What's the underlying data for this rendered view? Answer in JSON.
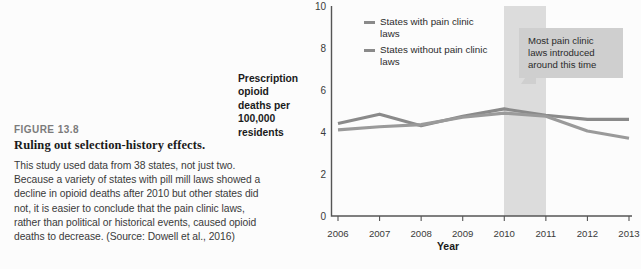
{
  "figure": {
    "label": "FIGURE 13.8",
    "title": "Ruling out selection-history effects.",
    "body": "This study used data from 38 states, not just two. Because a variety of states with pill mill laws showed a decline in opioid deaths after 2010 but other states did not, it is easier to conclude that the pain clinic laws, rather than political or historical events, caused opioid deaths to decrease. (Source: Dowell et al., 2016)"
  },
  "callout": {
    "text": "Most pain clinic laws introduced around this time"
  },
  "colors": {
    "series_with": "#8a8a8a",
    "series_without": "#9a9a9a",
    "band": "#dcdcdc",
    "callout_bg": "#cfcfcf",
    "axis": "#555555",
    "background": "#fcfcfc"
  },
  "chart_data": {
    "type": "line",
    "title": "",
    "xlabel": "Year",
    "ylabel": "Prescription opioid deaths per 100,000 residents",
    "ylabel_lines": [
      "Prescription",
      "opioid",
      "deaths per",
      "100,000",
      "residents"
    ],
    "categories": [
      2006,
      2007,
      2008,
      2009,
      2010,
      2011,
      2012,
      2013
    ],
    "x_ticks": [
      "2006",
      "2007",
      "2008",
      "2009",
      "2010",
      "2011",
      "2012",
      "2013"
    ],
    "y_ticks": [
      0,
      2,
      4,
      6,
      8,
      10
    ],
    "ylim": [
      0,
      10
    ],
    "xlim": [
      2006,
      2013
    ],
    "grid": false,
    "legend_position": "top-left-inside",
    "series": [
      {
        "name": "States with pain clinic laws",
        "values": [
          4.4,
          4.85,
          4.3,
          4.75,
          5.1,
          4.8,
          4.6,
          4.6
        ]
      },
      {
        "name": "States without pain clinic laws",
        "values": [
          4.1,
          4.25,
          4.35,
          4.7,
          4.9,
          4.75,
          4.05,
          3.7
        ]
      }
    ],
    "annotations": [
      {
        "type": "vertical-band",
        "x_start": 2010,
        "x_end": 2011,
        "label": "Most pain clinic laws introduced around this time"
      }
    ]
  }
}
